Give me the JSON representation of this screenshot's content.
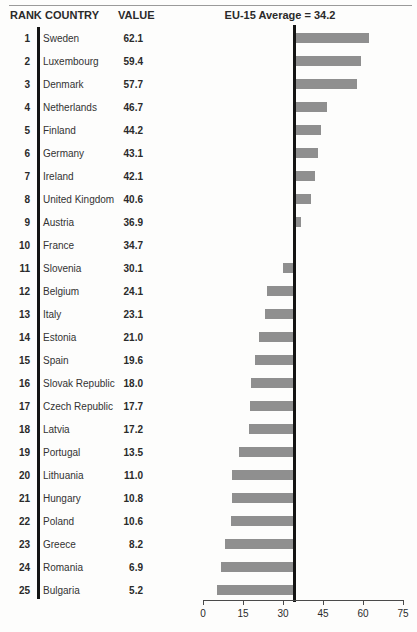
{
  "header": {
    "rank": "RANK",
    "country": "COUNTRY",
    "value": "VALUE",
    "average_label": "EU-15 Average = 34.2"
  },
  "chart_data": {
    "type": "bar",
    "orientation": "horizontal-deviation",
    "title": "EU-15 Average = 34.2",
    "average": 34.2,
    "xlim": [
      0,
      75
    ],
    "axis_ticks": [
      0,
      15,
      30,
      45,
      60,
      75
    ],
    "bar_color": "#8f8f8f",
    "reference_line_color": "#141414",
    "rows": [
      {
        "rank": 1,
        "country": "Sweden",
        "value": 62.1
      },
      {
        "rank": 2,
        "country": "Luxembourg",
        "value": 59.4
      },
      {
        "rank": 3,
        "country": "Denmark",
        "value": 57.7
      },
      {
        "rank": 4,
        "country": "Netherlands",
        "value": 46.7
      },
      {
        "rank": 5,
        "country": "Finland",
        "value": 44.2
      },
      {
        "rank": 6,
        "country": "Germany",
        "value": 43.1
      },
      {
        "rank": 7,
        "country": "Ireland",
        "value": 42.1
      },
      {
        "rank": 8,
        "country": "United Kingdom",
        "value": 40.6
      },
      {
        "rank": 9,
        "country": "Austria",
        "value": 36.9
      },
      {
        "rank": 10,
        "country": "France",
        "value": 34.7
      },
      {
        "rank": 11,
        "country": "Slovenia",
        "value": 30.1
      },
      {
        "rank": 12,
        "country": "Belgium",
        "value": 24.1
      },
      {
        "rank": 13,
        "country": "Italy",
        "value": 23.1
      },
      {
        "rank": 14,
        "country": "Estonia",
        "value": 21.0
      },
      {
        "rank": 15,
        "country": "Spain",
        "value": 19.6
      },
      {
        "rank": 16,
        "country": "Slovak Republic",
        "value": 18.0
      },
      {
        "rank": 17,
        "country": "Czech Republic",
        "value": 17.7
      },
      {
        "rank": 18,
        "country": "Latvia",
        "value": 17.2
      },
      {
        "rank": 19,
        "country": "Portugal",
        "value": 13.5
      },
      {
        "rank": 20,
        "country": "Lithuania",
        "value": 11.0
      },
      {
        "rank": 21,
        "country": "Hungary",
        "value": 10.8
      },
      {
        "rank": 22,
        "country": "Poland",
        "value": 10.6
      },
      {
        "rank": 23,
        "country": "Greece",
        "value": 8.2
      },
      {
        "rank": 24,
        "country": "Romania",
        "value": 6.9
      },
      {
        "rank": 25,
        "country": "Bulgaria",
        "value": 5.2
      }
    ]
  },
  "layout": {
    "chart_left_px": 203,
    "chart_width_px": 200,
    "rows_top_px": 27,
    "row_height_px": 23,
    "axis_y_px": 600
  }
}
